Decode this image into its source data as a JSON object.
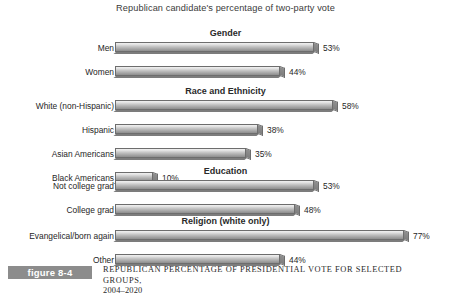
{
  "chart_title": "Republican candidate's percentage of two-party vote",
  "caption": {
    "tag": "figure 8-4",
    "line1": "REPUBLICAN PERCENTAGE OF PRESIDENTIAL VOTE FOR SELECTED GROUPS,",
    "line2": "2004–2020"
  },
  "chart_data": {
    "type": "bar",
    "orientation": "horizontal",
    "title": "Republican candidate's percentage of two-party vote",
    "xlabel": "",
    "ylabel": "",
    "xlim": [
      0,
      80
    ],
    "grid": false,
    "legend": "none",
    "value_suffix": "%",
    "groups": [
      {
        "name": "Gender",
        "categories": [
          "Men",
          "Women"
        ],
        "values": [
          53,
          44
        ],
        "labels": [
          "53%",
          "44%"
        ]
      },
      {
        "name": "Race and Ethnicity",
        "categories": [
          "White (non-Hispanic)",
          "Hispanic",
          "Asian Americans",
          "Black Americans"
        ],
        "values": [
          58,
          38,
          35,
          10
        ],
        "labels": [
          "58%",
          "38%",
          "35%",
          "10%"
        ]
      },
      {
        "name": "Education",
        "categories": [
          "Not college grad",
          "College grad"
        ],
        "values": [
          53,
          48
        ],
        "labels": [
          "53%",
          "48%"
        ]
      },
      {
        "name": "Religion (white only)",
        "categories": [
          "Evangelical/born again",
          "Other"
        ],
        "values": [
          77,
          44
        ],
        "labels": [
          "77%",
          "44%"
        ]
      }
    ]
  },
  "style": {
    "bar_fill_light": "#f0f0f0",
    "bar_fill_dark": "#8e8e8e",
    "bar_outline": "#6d6d6d",
    "tag_background": "#8c8c8c",
    "text_color": "#2b2b2b"
  }
}
